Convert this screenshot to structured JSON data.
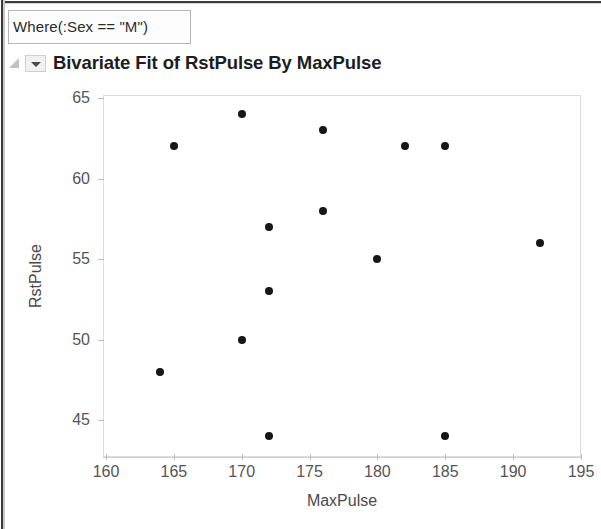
{
  "window": {
    "where_clause": "Where(:Sex == \"M\")",
    "report_title": "Bivariate Fit of RstPulse By MaxPulse",
    "disclosure_icon": "disclosure-triangle-icon",
    "dropdown_icon": "chevron-down-icon"
  },
  "chart_data": {
    "type": "scatter",
    "title": "Bivariate Fit of RstPulse By MaxPulse",
    "xlabel": "MaxPulse",
    "ylabel": "RstPulse",
    "xlim": [
      160,
      195
    ],
    "ylim": [
      43,
      65.5
    ],
    "xticks": [
      160,
      165,
      170,
      175,
      180,
      185,
      190,
      195
    ],
    "yticks": [
      45,
      50,
      55,
      60,
      65
    ],
    "grid": false,
    "legend": null,
    "marker_color": "#161616",
    "points": [
      {
        "x": 164,
        "y": 48
      },
      {
        "x": 165,
        "y": 62
      },
      {
        "x": 170,
        "y": 64
      },
      {
        "x": 170,
        "y": 50
      },
      {
        "x": 172,
        "y": 57
      },
      {
        "x": 172,
        "y": 53
      },
      {
        "x": 172,
        "y": 44
      },
      {
        "x": 176,
        "y": 63
      },
      {
        "x": 176,
        "y": 58
      },
      {
        "x": 180,
        "y": 55
      },
      {
        "x": 182,
        "y": 62
      },
      {
        "x": 185,
        "y": 62
      },
      {
        "x": 185,
        "y": 44
      },
      {
        "x": 192,
        "y": 56
      }
    ]
  }
}
